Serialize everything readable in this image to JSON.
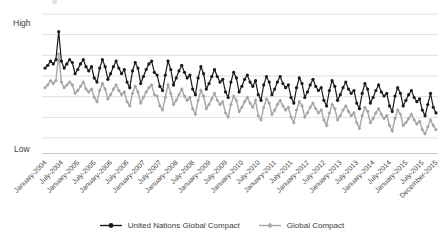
{
  "page": {
    "background": "#ffffff",
    "top_edge_artifact_glyph": "g"
  },
  "chart_data": {
    "type": "line",
    "title": "",
    "xlabel": "",
    "ylabel": "",
    "y_axis": {
      "high_label": "High",
      "low_label": "Low",
      "range": [
        0,
        100
      ],
      "gridlines": 7,
      "grid": "horizontal"
    },
    "x_axis": {
      "start": "January-2004",
      "end": "December-2015",
      "interval": "monthly",
      "points": 144
    },
    "x_tick_labels": [
      "January-2004",
      "July-2004",
      "January-2005",
      "July-2005",
      "January-2006",
      "July-2006",
      "January-2007",
      "July-2007",
      "January-2008",
      "July-2008",
      "January-2009",
      "July-2009",
      "January-2010",
      "July-2010",
      "January-2011",
      "July-2011",
      "January-2012",
      "July-2012",
      "January-2013",
      "July-2013",
      "January-2014",
      "July-2014",
      "January-2015",
      "July-2015",
      "December-2015"
    ],
    "x_tick_indices": [
      0,
      6,
      12,
      18,
      24,
      30,
      36,
      42,
      48,
      54,
      60,
      66,
      72,
      78,
      84,
      90,
      96,
      102,
      108,
      114,
      120,
      126,
      132,
      138,
      143
    ],
    "legend_position": "bottom",
    "colors": {
      "grid": "#d7d7d7",
      "axis": "#c2c2c2",
      "tick_text": "#474747"
    },
    "series": [
      {
        "name": "United Nations Global Compact",
        "color": "#1a1a1a",
        "marker": "circle",
        "line_width": 1.2,
        "values": [
          61,
          63,
          66,
          64,
          67,
          87,
          66,
          61,
          64,
          67,
          65,
          57,
          60,
          64,
          67,
          62,
          59,
          62,
          54,
          51,
          61,
          67,
          62,
          53,
          57,
          62,
          66,
          61,
          57,
          60,
          51,
          47,
          59,
          65,
          61,
          50,
          55,
          60,
          64,
          66,
          58,
          56,
          48,
          45,
          56,
          66,
          60,
          49,
          54,
          59,
          63,
          58,
          54,
          56,
          46,
          42,
          54,
          62,
          57,
          46,
          50,
          55,
          60,
          55,
          51,
          53,
          44,
          40,
          51,
          58,
          54,
          44,
          48,
          53,
          56,
          51,
          48,
          52,
          42,
          38,
          49,
          55,
          51,
          42,
          46,
          51,
          55,
          50,
          47,
          49,
          40,
          36,
          47,
          54,
          50,
          40,
          44,
          49,
          53,
          48,
          45,
          47,
          38,
          34,
          45,
          52,
          48,
          38,
          42,
          47,
          51,
          46,
          43,
          45,
          36,
          32,
          43,
          50,
          46,
          36,
          40,
          45,
          49,
          44,
          41,
          43,
          34,
          30,
          41,
          47,
          43,
          34,
          38,
          42,
          45,
          40,
          37,
          39,
          31,
          27,
          35,
          43,
          33,
          29
        ]
      },
      {
        "name": "Global Compact",
        "color": "#a6a6a6",
        "marker": "diamond",
        "line_width": 1.4,
        "values": [
          47,
          49,
          52,
          50,
          52,
          71,
          51,
          47,
          49,
          51,
          49,
          43,
          45,
          48,
          51,
          46,
          44,
          46,
          40,
          37,
          45,
          50,
          46,
          39,
          42,
          46,
          49,
          45,
          42,
          44,
          37,
          34,
          43,
          48,
          44,
          36,
          40,
          44,
          47,
          49,
          42,
          41,
          34,
          31,
          40,
          49,
          43,
          35,
          38,
          42,
          46,
          41,
          38,
          40,
          32,
          28,
          38,
          45,
          41,
          32,
          35,
          39,
          43,
          38,
          35,
          37,
          29,
          26,
          35,
          41,
          38,
          30,
          33,
          37,
          40,
          36,
          33,
          38,
          27,
          24,
          33,
          39,
          36,
          28,
          31,
          35,
          38,
          34,
          31,
          33,
          26,
          22,
          31,
          37,
          34,
          26,
          29,
          33,
          36,
          32,
          29,
          31,
          24,
          20,
          29,
          35,
          32,
          24,
          27,
          31,
          34,
          30,
          27,
          29,
          22,
          18,
          27,
          33,
          30,
          22,
          25,
          29,
          32,
          28,
          25,
          27,
          20,
          16,
          25,
          31,
          28,
          20,
          22,
          25,
          28,
          24,
          21,
          23,
          17,
          14,
          19,
          24,
          20,
          17
        ]
      }
    ]
  }
}
